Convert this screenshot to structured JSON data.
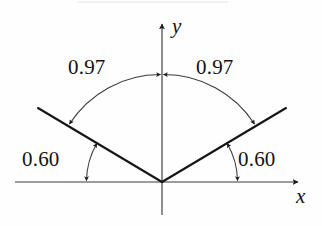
{
  "figure": {
    "type": "angle-diagram",
    "background_color": "#fefefe",
    "stroke_color": "#1a1a1a",
    "axes": {
      "x_label": "x",
      "y_label": "y",
      "origin": {
        "x": 162,
        "y": 182
      },
      "x_axis": {
        "x_start": 15,
        "x_end": 300,
        "y": 182,
        "arrow_at_end": true
      },
      "y_axis": {
        "y_start": 22,
        "y_end": 215,
        "x": 162,
        "arrow_at_top": true
      }
    },
    "rays": [
      {
        "name": "left-ray",
        "from": {
          "x": 162,
          "y": 182
        },
        "to": {
          "x": 38,
          "y": 108
        }
      },
      {
        "name": "right-ray",
        "from": {
          "x": 162,
          "y": 182
        },
        "to": {
          "x": 286,
          "y": 108
        }
      }
    ],
    "angle_arcs": [
      {
        "name": "upper-left-arc",
        "label": "0.97",
        "label_position": {
          "x": 70,
          "y": 55
        },
        "radius": 108,
        "from_deg": 90,
        "to_deg": 149,
        "double_arrow": true
      },
      {
        "name": "upper-right-arc",
        "label": "0.97",
        "label_position": {
          "x": 198,
          "y": 55
        },
        "radius": 108,
        "from_deg": 90,
        "to_deg": 31,
        "double_arrow": true
      },
      {
        "name": "lower-left-arc",
        "label": "0.60",
        "label_position": {
          "x": 22,
          "y": 148
        },
        "radius": 76,
        "from_deg": 180,
        "to_deg": 149,
        "double_arrow": true
      },
      {
        "name": "lower-right-arc",
        "label": "0.60",
        "label_position": {
          "x": 237,
          "y": 148
        },
        "radius": 76,
        "from_deg": 0,
        "to_deg": 31,
        "double_arrow": true
      }
    ],
    "labels": {
      "upper_left_value": "0.97",
      "upper_right_value": "0.97",
      "lower_left_value": "0.60",
      "lower_right_value": "0.60",
      "x_axis_name": "x",
      "y_axis_name": "y"
    }
  }
}
